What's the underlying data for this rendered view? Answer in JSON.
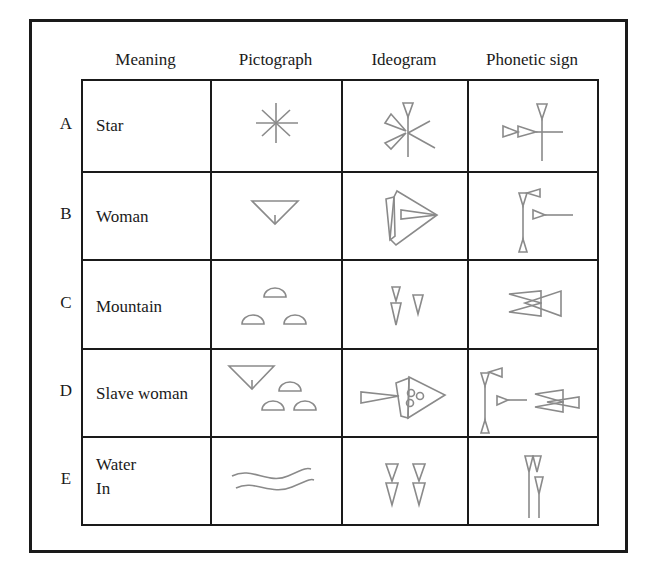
{
  "table": {
    "headers": [
      "Meaning",
      "Pictograph",
      "Ideogram",
      "Phonetic sign"
    ],
    "rows": [
      {
        "label": "A",
        "meaning": [
          "Star"
        ],
        "pictograph": "star-pictograph",
        "ideogram": "star-ideogram",
        "phonetic": "star-phonetic"
      },
      {
        "label": "B",
        "meaning": [
          "Woman"
        ],
        "pictograph": "woman-pictograph",
        "ideogram": "woman-ideogram",
        "phonetic": "woman-phonetic"
      },
      {
        "label": "C",
        "meaning": [
          "Mountain"
        ],
        "pictograph": "mountain-pictograph",
        "ideogram": "mountain-ideogram",
        "phonetic": "mountain-phonetic"
      },
      {
        "label": "D",
        "meaning": [
          "Slave woman"
        ],
        "pictograph": "slave-woman-pictograph",
        "ideogram": "slave-woman-ideogram",
        "phonetic": "slave-woman-phonetic"
      },
      {
        "label": "E",
        "meaning": [
          "Water",
          "In"
        ],
        "pictograph": "water-pictograph",
        "ideogram": "water-ideogram",
        "phonetic": "water-phonetic"
      }
    ]
  },
  "colors": {
    "line": "#1a1a1a",
    "glyph_stroke": "#8a8a8a",
    "background": "#ffffff"
  }
}
